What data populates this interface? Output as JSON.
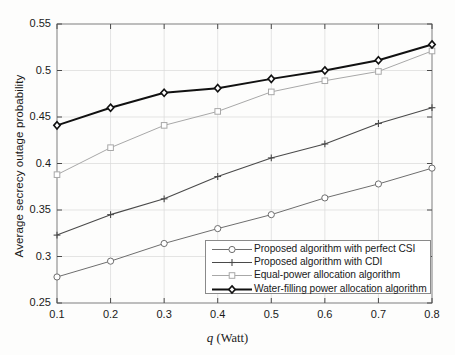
{
  "chart_data": {
    "type": "line",
    "title": "",
    "xlabel": "q (Watt)",
    "xlabel_symbol": "q",
    "xlabel_unit": "(Watt)",
    "ylabel": "Average secrecy outage probability",
    "x": [
      0.1,
      0.2,
      0.3,
      0.4,
      0.5,
      0.6,
      0.7,
      0.8
    ],
    "xlim": [
      0.1,
      0.8
    ],
    "ylim": [
      0.25,
      0.55
    ],
    "xticks": [
      "0.1",
      "0.2",
      "0.3",
      "0.4",
      "0.5",
      "0.6",
      "0.7",
      "0.8"
    ],
    "yticks": [
      "0.25",
      "0.3",
      "0.35",
      "0.4",
      "0.45",
      "0.5",
      "0.55"
    ],
    "grid": true,
    "legend_position": "lower right",
    "series": [
      {
        "name": "Proposed algorithm with perfect CSI",
        "marker": "circle",
        "color": "#6e6e6e",
        "linewidth": 1.0,
        "values": [
          0.278,
          0.295,
          0.314,
          0.33,
          0.345,
          0.363,
          0.378,
          0.395
        ]
      },
      {
        "name": "Proposed algorithm with CDI",
        "marker": "plus",
        "color": "#4a4a4a",
        "linewidth": 1.1,
        "values": [
          0.323,
          0.345,
          0.362,
          0.386,
          0.406,
          0.421,
          0.443,
          0.46
        ]
      },
      {
        "name": "Equal-power allocation algorithm",
        "marker": "square",
        "color": "#a8a8a8",
        "linewidth": 1.0,
        "values": [
          0.388,
          0.417,
          0.441,
          0.456,
          0.477,
          0.489,
          0.499,
          0.521
        ]
      },
      {
        "name": "Water-filling power allocation algorithm",
        "marker": "diamond",
        "color": "#111111",
        "linewidth": 2.0,
        "values": [
          0.441,
          0.46,
          0.476,
          0.481,
          0.491,
          0.5,
          0.511,
          0.528
        ]
      }
    ]
  },
  "axes": {
    "frame_color": "#8a8a8a",
    "grid_color": "#d8d8d8"
  }
}
